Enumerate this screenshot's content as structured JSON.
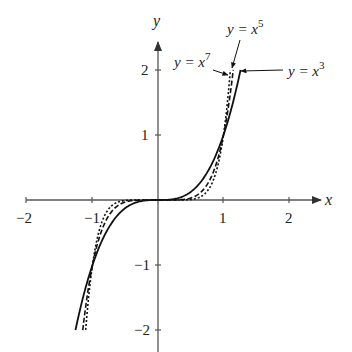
{
  "chart_data": {
    "type": "line",
    "title": "",
    "xlabel": "x",
    "ylabel": "y",
    "xlim": [
      -2,
      2
    ],
    "ylim": [
      -2,
      2
    ],
    "grid": false,
    "x_ticks": [
      -2,
      -1,
      1,
      2
    ],
    "y_ticks": [
      -2,
      -1,
      1,
      2
    ],
    "x_tick_labels": [
      "−2",
      "−1",
      "1",
      "2"
    ],
    "y_tick_labels": [
      "−2",
      "−1",
      "1",
      "2"
    ],
    "series": [
      {
        "name": "y = x^3",
        "label_base": "y = x",
        "exponent": "3",
        "power": 3,
        "style": "solid",
        "x_range": [
          -1.26,
          1.26
        ],
        "x": [
          -1.26,
          -1,
          -0.5,
          0,
          0.5,
          1,
          1.26
        ],
        "values": [
          -2.0,
          -1,
          -0.125,
          0,
          0.125,
          1,
          2.0
        ]
      },
      {
        "name": "y = x^5",
        "label_base": "y = x",
        "exponent": "5",
        "power": 5,
        "style": "dashed",
        "x_range": [
          -1.149,
          1.149
        ],
        "x": [
          -1.149,
          -1,
          -0.5,
          0,
          0.5,
          1,
          1.149
        ],
        "values": [
          -2.0,
          -1,
          -0.03125,
          0,
          0.03125,
          1,
          2.0
        ]
      },
      {
        "name": "y = x^7",
        "label_base": "y = x",
        "exponent": "7",
        "power": 7,
        "style": "dotted",
        "x_range": [
          -1.104,
          1.104
        ],
        "x": [
          -1.104,
          -1,
          -0.5,
          0,
          0.5,
          1,
          1.104
        ],
        "values": [
          -2.0,
          -1,
          -0.0078,
          0,
          0.0078,
          1,
          2.0
        ]
      }
    ],
    "annotations": [
      {
        "text": "y = x^5",
        "position": "top, above curves"
      },
      {
        "text": "y = x^7",
        "position": "left of curve ends"
      },
      {
        "text": "y = x^3",
        "position": "right of curve ends"
      }
    ],
    "legend": "none (inline annotations with arrows)"
  },
  "colors": {
    "axis": "#555555",
    "curve": "#111111",
    "text": "#222222"
  }
}
